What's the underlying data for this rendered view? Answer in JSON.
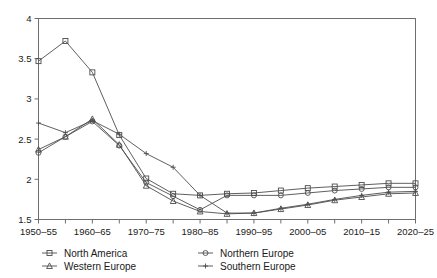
{
  "chart_data": {
    "type": "line",
    "title": "",
    "xlabel": "",
    "ylabel": "",
    "ylim": [
      1.5,
      4
    ],
    "yticks": [
      1.5,
      2,
      2.5,
      3,
      3.5,
      4
    ],
    "yticklabels": [
      "1.5",
      "2",
      "2.5",
      "3",
      "3.5",
      "4"
    ],
    "grid": false,
    "legend_position": "below-axes",
    "categories": [
      "1950-55",
      "1955-60",
      "1960-65",
      "1965-70",
      "1970-75",
      "1975-80",
      "1980-85",
      "1985-90",
      "1990-95",
      "1995-00",
      "2000-05",
      "2005-10",
      "2010-15",
      "2015-20",
      "2020-25"
    ],
    "xticklabels": [
      "1950–55",
      "",
      "1960–65",
      "",
      "1970–75",
      "",
      "1980–85",
      "",
      "1990–95",
      "",
      "2000–05",
      "",
      "2010–15",
      "",
      "2020–25"
    ],
    "series": [
      {
        "name": "North America",
        "marker": "square",
        "color": "#4d4d4d",
        "values": [
          3.47,
          3.72,
          3.33,
          2.55,
          2.01,
          1.82,
          1.8,
          1.82,
          1.83,
          1.86,
          1.89,
          1.91,
          1.93,
          1.95,
          1.95
        ]
      },
      {
        "name": "Northern Europe",
        "marker": "circle",
        "color": "#4d4d4d",
        "values": [
          2.33,
          2.53,
          2.72,
          2.42,
          1.96,
          1.79,
          1.62,
          1.8,
          1.8,
          1.8,
          1.83,
          1.86,
          1.88,
          1.9,
          1.9
        ]
      },
      {
        "name": "Western Europe",
        "marker": "triangle",
        "color": "#4d4d4d",
        "values": [
          2.37,
          2.53,
          2.75,
          2.43,
          1.92,
          1.73,
          1.6,
          1.57,
          1.58,
          1.63,
          1.68,
          1.74,
          1.78,
          1.82,
          1.83
        ]
      },
      {
        "name": "Southern Europe",
        "marker": "cross",
        "color": "#4d4d4d",
        "values": [
          2.7,
          2.58,
          2.73,
          2.56,
          2.32,
          2.15,
          1.8,
          1.58,
          1.58,
          1.64,
          1.69,
          1.75,
          1.8,
          1.84,
          1.85
        ]
      }
    ],
    "legend": [
      {
        "label": "North America",
        "marker": "square"
      },
      {
        "label": "Northern Europe",
        "marker": "circle"
      },
      {
        "label": "Western Europe",
        "marker": "triangle"
      },
      {
        "label": "Southern Europe",
        "marker": "cross"
      }
    ]
  },
  "colors": {
    "axis": "#6e6e6e",
    "line": "#4d4d4d",
    "text": "#1a1a1a",
    "background": "#ffffff"
  }
}
